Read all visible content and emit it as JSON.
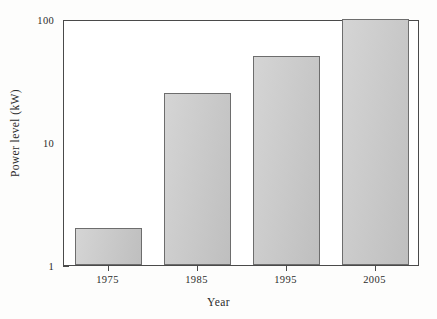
{
  "chart_data": {
    "type": "bar",
    "title": "",
    "subtitle": "",
    "xlabel": "Year",
    "ylabel": "Power level (kW)",
    "categories": [
      "1975",
      "1985",
      "1995",
      "2005"
    ],
    "values": [
      2,
      25,
      50,
      100
    ],
    "series": [
      {
        "name": "Power level",
        "values": [
          2,
          25,
          50,
          100
        ]
      }
    ],
    "yscale": "log",
    "ylim": [
      1,
      100
    ],
    "y_major_ticks": [
      1,
      10,
      100
    ],
    "y_tick_labels": [
      "1",
      "10",
      "100"
    ],
    "y_minor_ticks": [
      2,
      3,
      4,
      5,
      6,
      7,
      8,
      9,
      20,
      30,
      40,
      50,
      60,
      70,
      80,
      90
    ],
    "grid": false,
    "legend": "none",
    "annotations": []
  },
  "style": {
    "bar_fill": "#c9c9c9",
    "bar_stroke": "#6d6d6d",
    "axis_color": "#4a4a4a",
    "plot_background": "#ffffff",
    "page_background": "#fdfdfc",
    "text_color": "#2b2b2b"
  }
}
